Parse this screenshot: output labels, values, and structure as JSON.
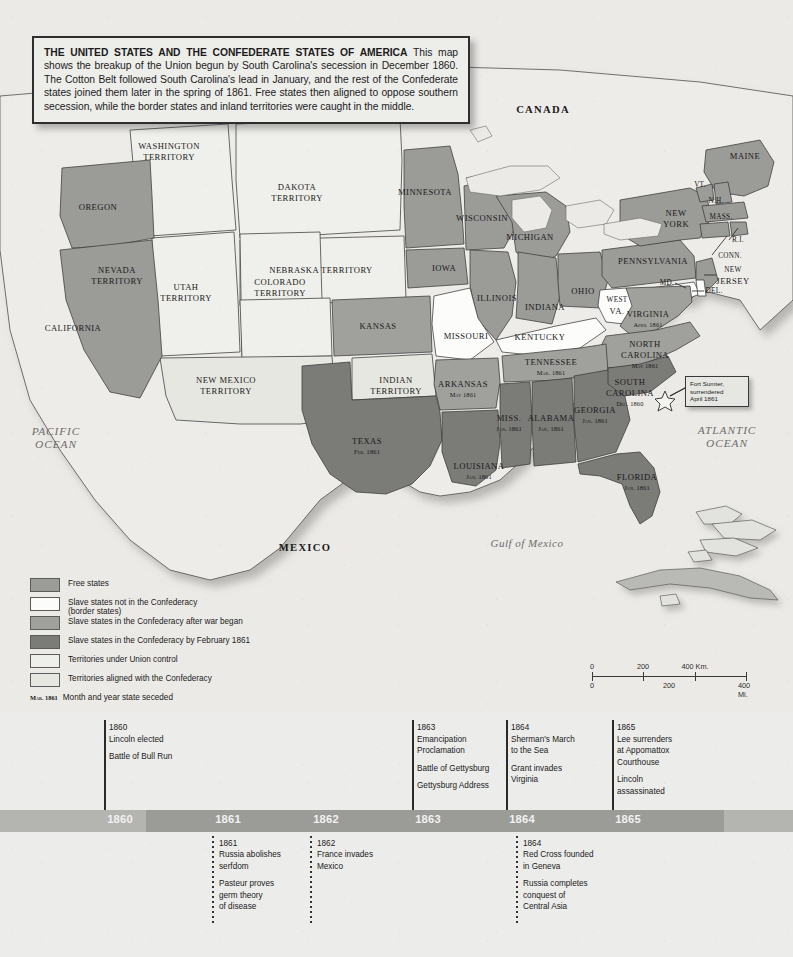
{
  "title_box": {
    "heading": "THE UNITED STATES AND THE CONFEDERATE STATES OF AMERICA",
    "body": " This map shows the breakup of the Union begun by South Carolina's secession in December 1860.  The Cotton Belt followed South Carolina's lead in January, and the rest of the Confederate states joined them later in the spring of 1861.  Free states then aligned to oppose southern secession, while the border states and inland territories were caught in the middle."
  },
  "colors": {
    "free_state": "#9b9b98",
    "border_state": "#fbfbf8",
    "confed_after_war": "#a0a09c",
    "confed_by_feb": "#7b7b78",
    "territory_union": "#eeeeea",
    "territory_confed": "#e6e6e1",
    "water": "#edeceа",
    "outline": "#3a3a3a"
  },
  "map": {
    "countries": [
      {
        "name": "CANADA",
        "x": 543,
        "y": 110
      },
      {
        "name": "MEXICO",
        "x": 305,
        "y": 548
      }
    ],
    "oceans": [
      {
        "line1": "PACIFIC",
        "line2": "OCEAN",
        "x": 56,
        "y": 438
      },
      {
        "line1": "ATLANTIC",
        "line2": "OCEAN",
        "x": 727,
        "y": 437
      }
    ],
    "seas": [
      {
        "name": "Gulf of Mexico",
        "x": 527,
        "y": 543
      }
    ],
    "states": [
      {
        "name": "OREGON",
        "x": 98,
        "y": 207,
        "cls": ""
      },
      {
        "name": "CALIFORNIA",
        "x": 73,
        "y": 328,
        "cls": ""
      },
      {
        "name": "WASHINGTON",
        "name2": "TERRITORY",
        "x": 169,
        "y": 151,
        "cls": ""
      },
      {
        "name": "NEVADA",
        "name2": "TERRITORY",
        "x": 117,
        "y": 275,
        "cls": ""
      },
      {
        "name": "UTAH",
        "name2": "TERRITORY",
        "x": 186,
        "y": 292,
        "cls": ""
      },
      {
        "name": "DAKOTA",
        "name2": "TERRITORY",
        "x": 297,
        "y": 192,
        "cls": ""
      },
      {
        "name": "NEBRASKA TERRITORY",
        "x": 321,
        "y": 270,
        "cls": ""
      },
      {
        "name": "COLORADO",
        "name2": "TERRITORY",
        "x": 280,
        "y": 287,
        "cls": ""
      },
      {
        "name": "NEW MEXICO",
        "name2": "TERRITORY",
        "x": 226,
        "y": 385,
        "cls": ""
      },
      {
        "name": "KANSAS",
        "x": 378,
        "y": 326,
        "cls": ""
      },
      {
        "name": "INDIAN",
        "name2": "TERRITORY",
        "x": 396,
        "y": 385,
        "cls": ""
      },
      {
        "name": "MINNESOTA",
        "x": 425,
        "y": 192,
        "cls": ""
      },
      {
        "name": "WISCONSIN",
        "x": 482,
        "y": 218,
        "cls": ""
      },
      {
        "name": "IOWA",
        "x": 444,
        "y": 268,
        "cls": ""
      },
      {
        "name": "MISSOURI",
        "x": 466,
        "y": 336,
        "cls": ""
      },
      {
        "name": "ILLINOIS",
        "x": 497,
        "y": 298,
        "cls": ""
      },
      {
        "name": "INDIANA",
        "x": 545,
        "y": 307,
        "cls": ""
      },
      {
        "name": "MICHIGAN",
        "x": 530,
        "y": 237,
        "cls": ""
      },
      {
        "name": "OHIO",
        "x": 583,
        "y": 291,
        "cls": ""
      },
      {
        "name": "KENTUCKY",
        "x": 540,
        "y": 337,
        "cls": ""
      },
      {
        "name": "PENNSYLVANIA",
        "x": 653,
        "y": 261,
        "cls": ""
      },
      {
        "name": "NEW",
        "name2": "YORK",
        "x": 676,
        "y": 218,
        "cls": ""
      },
      {
        "name": "MAINE",
        "x": 745,
        "y": 156,
        "cls": ""
      },
      {
        "name": "VT.",
        "x": 700,
        "y": 185,
        "cls": "sm"
      },
      {
        "name": "N.H.",
        "x": 716,
        "y": 201,
        "cls": "sm"
      },
      {
        "name": "MASS.",
        "x": 721,
        "y": 217,
        "cls": "sm"
      },
      {
        "name": "R.I.",
        "x": 738,
        "y": 240,
        "cls": "sm"
      },
      {
        "name": "CONN.",
        "x": 730,
        "y": 256,
        "cls": "sm"
      },
      {
        "name": "NEW",
        "name2": "JERSEY",
        "x": 733,
        "y": 275,
        "cls": "sm"
      },
      {
        "name": "DEL.",
        "x": 714,
        "y": 291,
        "cls": "sm"
      },
      {
        "name": "MD.",
        "x": 667,
        "y": 283,
        "cls": "sm"
      },
      {
        "name": "WEST",
        "name2": "VA.",
        "x": 617,
        "y": 305,
        "cls": "sm"
      },
      {
        "name": "VIRGINIA",
        "date": "April 1861",
        "x": 648,
        "y": 320,
        "cls": ""
      },
      {
        "name": "NORTH",
        "name2": "CAROLINA",
        "date": "May 1861",
        "x": 645,
        "y": 355,
        "cls": ""
      },
      {
        "name": "SOUTH",
        "name2": "CAROLINA",
        "date": "Dec. 1860",
        "x": 630,
        "y": 393,
        "cls": ""
      },
      {
        "name": "TENNESSEE",
        "date": "Mar. 1861",
        "x": 551,
        "y": 368,
        "cls": ""
      },
      {
        "name": "ARKANSAS",
        "date": "May 1861",
        "x": 463,
        "y": 390,
        "cls": ""
      },
      {
        "name": "MISS.",
        "date": "Jan. 1861",
        "x": 509,
        "y": 424,
        "cls": ""
      },
      {
        "name": "ALABAMA",
        "date": "Jan. 1861",
        "x": 551,
        "y": 424,
        "cls": ""
      },
      {
        "name": "GEORGIA",
        "date": "Jan. 1861",
        "x": 595,
        "y": 416,
        "cls": ""
      },
      {
        "name": "FLORIDA",
        "date": "Jan. 1861",
        "x": 637,
        "y": 483,
        "cls": ""
      },
      {
        "name": "LOUISIANA",
        "date": "Jan. 1861",
        "x": 479,
        "y": 472,
        "cls": ""
      },
      {
        "name": "TEXAS",
        "date": "Feb. 1861",
        "x": 367,
        "y": 447,
        "cls": ""
      }
    ],
    "callout": {
      "line1": "Fort Sumter,",
      "line2": "surrendered",
      "line3": "April 1861"
    }
  },
  "legend": {
    "items": [
      {
        "label": "Free states",
        "sub": "",
        "swatch": "#9b9b98"
      },
      {
        "label": "Slave states not in the Confederacy",
        "sub": "(border states)",
        "swatch": "#fcfcfa"
      },
      {
        "label": "Slave states in the Confederacy after war began",
        "sub": "",
        "swatch": "#a0a09c"
      },
      {
        "label": "Slave states in the Confederacy by February 1861",
        "sub": "",
        "swatch": "#7b7b78"
      },
      {
        "label": "Territories under Union control",
        "sub": "",
        "swatch": "#eeeeea"
      },
      {
        "label": "Territories aligned with the Confederacy",
        "sub": "",
        "swatch": "#e7e7e2"
      }
    ],
    "date_key": "Mar. 1861",
    "date_text": "Month and year state seceded"
  },
  "scalebar": {
    "km_labels": [
      "0",
      "200",
      "400 Km."
    ],
    "mi_labels": [
      "0",
      "200",
      "400 Mi."
    ]
  },
  "timeline": {
    "years": [
      "1860",
      "1861",
      "1862",
      "1863",
      "1864",
      "1865"
    ],
    "events_above": [
      {
        "year": "1860",
        "lines": [
          "Lincoln elected"
        ],
        "group2": [
          "Battle of Bull Run"
        ],
        "x": 104
      },
      {
        "year": "1863",
        "lines": [
          "Emancipation",
          "Proclamation"
        ],
        "group2": [
          "Battle of Gettysburg"
        ],
        "group3": [
          "Gettysburg Address"
        ],
        "x": 412
      },
      {
        "year": "1864",
        "lines": [
          "Sherman's March",
          "to the Sea"
        ],
        "group2": [
          "Grant invades",
          "Virginia"
        ],
        "x": 506
      },
      {
        "year": "1865",
        "lines": [
          "Lee surrenders",
          "at Appomattox",
          "Courthouse"
        ],
        "group2": [
          "Lincoln",
          "assassinated"
        ],
        "x": 612
      }
    ],
    "events_below": [
      {
        "year": "1861",
        "lines": [
          "Russia abolishes",
          "serfdom"
        ],
        "group2": [
          "Pasteur proves",
          "germ theory",
          "of disease"
        ],
        "x": 212
      },
      {
        "year": "1862",
        "lines": [
          "France invades",
          "Mexico"
        ],
        "x": 310
      },
      {
        "year": "1864",
        "lines": [
          "Red Cross founded",
          "in Geneva"
        ],
        "group2": [
          "Russia completes",
          "conquest of",
          "Central Asia"
        ],
        "x": 516
      }
    ]
  }
}
